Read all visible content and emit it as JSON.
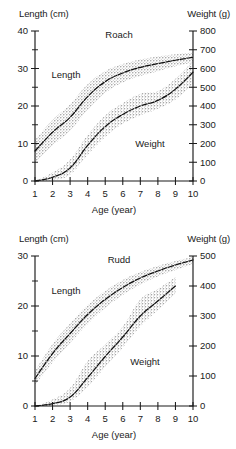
{
  "figure": {
    "panels": [
      {
        "id": "roach",
        "species_label": "Roach",
        "left_axis_title": "Length (cm)",
        "right_axis_title": "Weight (g)",
        "x_axis_title": "Age (year)",
        "length_series_label": "Length",
        "weight_series_label": "Weight"
      },
      {
        "id": "rudd",
        "species_label": "Rudd",
        "left_axis_title": "Length (cm)",
        "right_axis_title": "Weight (g)",
        "x_axis_title": "Age (year)",
        "length_series_label": "Length",
        "weight_series_label": "Weight"
      }
    ]
  },
  "chart_data": [
    {
      "type": "line",
      "title": "Roach",
      "xlabel": "Age (year)",
      "ylabel": "Length (cm)",
      "y2label": "Weight (g)",
      "xlim": [
        1,
        10
      ],
      "ylim": [
        0,
        40
      ],
      "y2lim": [
        0,
        800
      ],
      "xticks": [
        1,
        2,
        3,
        4,
        5,
        6,
        7,
        8,
        9,
        10
      ],
      "yticks": [
        0,
        10,
        20,
        30,
        40
      ],
      "y_minor_ticks": [
        5,
        15,
        25,
        35
      ],
      "y2ticks": [
        0,
        100,
        200,
        300,
        400,
        500,
        600,
        700,
        800
      ],
      "grid": false,
      "legend": "inline-annotations",
      "x": [
        1,
        2,
        3,
        4,
        5,
        6,
        7,
        8,
        9,
        10
      ],
      "series": [
        {
          "name": "Length",
          "axis": "left",
          "units": "cm",
          "values": [
            8.0,
            13.0,
            17.0,
            22.5,
            26.5,
            28.8,
            30.3,
            31.3,
            32.2,
            33.0
          ],
          "band_lower": [
            5.0,
            9.5,
            13.5,
            19.0,
            23.5,
            26.3,
            28.0,
            29.3,
            30.6,
            31.6
          ],
          "band_upper": [
            11.0,
            16.3,
            20.5,
            25.8,
            29.3,
            31.2,
            32.4,
            33.2,
            33.8,
            34.3
          ]
        },
        {
          "name": "Weight",
          "axis": "right",
          "units": "g",
          "values": [
            0,
            20,
            70,
            190,
            290,
            355,
            400,
            430,
            490,
            580
          ],
          "band_lower": [
            0,
            5,
            35,
            140,
            235,
            305,
            350,
            385,
            435,
            520
          ],
          "band_upper": [
            0,
            45,
            115,
            245,
            350,
            415,
            465,
            480,
            545,
            640
          ]
        }
      ]
    },
    {
      "type": "line",
      "title": "Rudd",
      "xlabel": "Age (year)",
      "ylabel": "Length (cm)",
      "y2label": "Weight (g)",
      "xlim": [
        1,
        10
      ],
      "ylim": [
        0,
        30
      ],
      "y2lim": [
        0,
        500
      ],
      "xticks": [
        1,
        2,
        3,
        4,
        5,
        6,
        7,
        8,
        9,
        10
      ],
      "yticks": [
        0,
        10,
        20,
        30
      ],
      "y_minor_ticks": [
        5,
        15,
        25
      ],
      "y2ticks": [
        0,
        100,
        200,
        300,
        400,
        500
      ],
      "grid": false,
      "legend": "inline-annotations",
      "x": [
        1,
        2,
        3,
        4,
        5,
        6,
        7,
        8,
        9,
        10
      ],
      "series": [
        {
          "name": "Length",
          "axis": "left",
          "units": "cm",
          "values": [
            5.5,
            10.5,
            14.5,
            18.3,
            21.3,
            23.7,
            25.6,
            27.0,
            28.2,
            29.2
          ],
          "band_lower": [
            4.2,
            8.7,
            12.6,
            16.4,
            19.6,
            22.2,
            24.3,
            25.9,
            27.2,
            28.4
          ],
          "band_upper": [
            7.0,
            12.4,
            16.5,
            20.2,
            23.0,
            25.2,
            26.8,
            28.0,
            29.0,
            29.8
          ]
        },
        {
          "name": "Weight",
          "axis": "right",
          "units": "g",
          "values": [
            0,
            8,
            30,
            95,
            165,
            230,
            300,
            350,
            400
          ],
          "band_lower": [
            0,
            2,
            15,
            65,
            130,
            195,
            265,
            320,
            375
          ],
          "band_upper": [
            0,
            22,
            60,
            150,
            205,
            265,
            355,
            390,
            430
          ]
        }
      ]
    }
  ]
}
